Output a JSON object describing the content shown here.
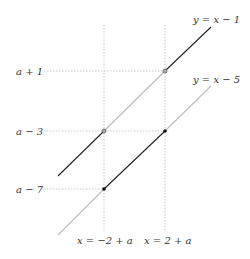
{
  "diagram": {
    "lines": [
      {
        "label": "y = x − 1"
      },
      {
        "label": "y = x − 5"
      }
    ],
    "y_labels": [
      "a + 1",
      "a − 3",
      "a − 7"
    ],
    "x_labels": [
      "x = −2 + a",
      "x = 2 + a"
    ],
    "colors": {
      "solid": "#222222",
      "faded": "#bbbbbb",
      "guide": "#bbbbbb"
    }
  }
}
